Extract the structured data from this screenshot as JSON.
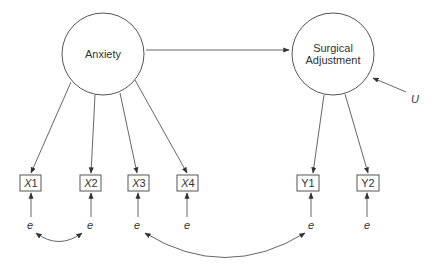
{
  "latent": {
    "anxiety": {
      "label": "Anxiety"
    },
    "surgical": {
      "label_line1": "Surgical",
      "label_line2": "Adjustment"
    }
  },
  "disturbance": {
    "label": "U"
  },
  "indicators": [
    {
      "letter": "X",
      "num": "1"
    },
    {
      "letter": "X",
      "num": "2"
    },
    {
      "letter": "X",
      "num": "3"
    },
    {
      "letter": "X",
      "num": "4"
    },
    {
      "letter": "Y",
      "num": "1"
    },
    {
      "letter": "Y",
      "num": "2"
    }
  ],
  "errors": [
    {
      "label": "e"
    },
    {
      "label": "e"
    },
    {
      "label": "e"
    },
    {
      "label": "e"
    },
    {
      "label": "e"
    },
    {
      "label": "e"
    }
  ]
}
